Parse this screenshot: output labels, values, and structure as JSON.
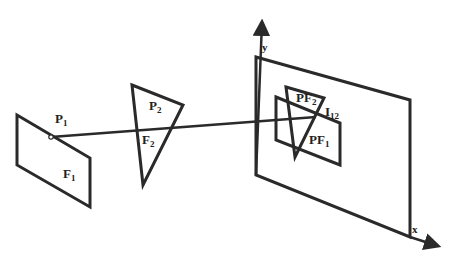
{
  "diagram": {
    "stroke_color": "#2a2a2a",
    "labels": {
      "p1": {
        "main": "P",
        "sub": "1"
      },
      "f1": {
        "main": "F",
        "sub": "1"
      },
      "p2": {
        "main": "P",
        "sub": "2"
      },
      "f2": {
        "main": "F",
        "sub": "2"
      },
      "pf2": {
        "main": "PF",
        "sub": "2"
      },
      "i12": {
        "main": "I",
        "sub": "12"
      },
      "pf1": {
        "main": "PF",
        "sub": "1"
      },
      "y_axis": "y",
      "x_axis": "x"
    },
    "shapes": {
      "face_f1": [
        [
          17,
          115
        ],
        [
          90,
          158
        ],
        [
          90,
          207
        ],
        [
          17,
          165
        ]
      ],
      "triangle_p2": [
        [
          132,
          85
        ],
        [
          183,
          105
        ],
        [
          143,
          185
        ]
      ],
      "image_plane": [
        [
          256,
          57
        ],
        [
          410,
          100
        ],
        [
          410,
          237
        ],
        [
          256,
          175
        ]
      ],
      "projected_pf1": [
        [
          276,
          97
        ],
        [
          340,
          123
        ],
        [
          340,
          165
        ],
        [
          276,
          140
        ]
      ],
      "projected_pf2": [
        [
          286,
          87
        ],
        [
          324,
          98
        ],
        [
          295,
          157
        ]
      ],
      "ray": [
        [
          51,
          137
        ],
        [
          316,
          117
        ]
      ],
      "y_axis": [
        [
          256,
          175
        ],
        [
          262,
          18
        ]
      ],
      "x_axis": [
        [
          410,
          237
        ],
        [
          440,
          247
        ]
      ]
    }
  }
}
